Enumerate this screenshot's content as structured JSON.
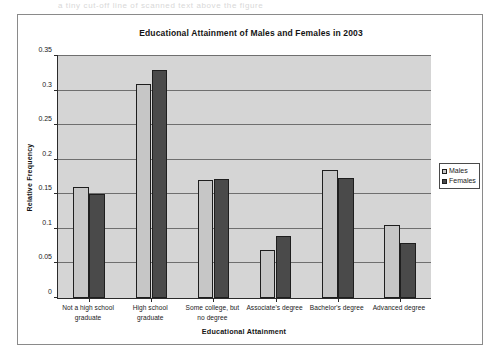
{
  "artifact_text": "a tiny cut-off line of scanned text above the figure",
  "figure": {
    "title": "Educational Attainment of Males and Females in 2003",
    "x_axis_title": "Educational Attainment",
    "y_axis_title": "Relative Frequency"
  },
  "legend": {
    "items": [
      {
        "label": "Males",
        "color": "#c6c6c6",
        "swatch": "males-swatch"
      },
      {
        "label": "Females",
        "color": "#4a4a4a",
        "swatch": "females-swatch"
      }
    ]
  },
  "chart_data": {
    "type": "bar",
    "title": "Educational Attainment of Males and Females in 2003",
    "xlabel": "Educational Attainment",
    "ylabel": "Relative Frequency",
    "categories": [
      "Not a high school graduate",
      "High school graduate",
      "Some college, but no degree",
      "Associate's degree",
      "Bachelor's degree",
      "Advanced degree"
    ],
    "category_lines": [
      [
        "Not a high school",
        "graduate"
      ],
      [
        "High school",
        "graduate"
      ],
      [
        "Some college, but",
        "no degree"
      ],
      [
        "Associate's degree"
      ],
      [
        "Bachelor's degree"
      ],
      [
        "Advanced degree"
      ]
    ],
    "series": [
      {
        "name": "Males",
        "color": "#c6c6c6",
        "values": [
          0.16,
          0.31,
          0.17,
          0.07,
          0.185,
          0.105
        ]
      },
      {
        "name": "Females",
        "color": "#4a4a4a",
        "values": [
          0.15,
          0.33,
          0.172,
          0.09,
          0.174,
          0.08
        ]
      }
    ],
    "ylim": [
      0,
      0.35
    ],
    "ytick_values": [
      0,
      0.05,
      0.1,
      0.15,
      0.2,
      0.25,
      0.3,
      0.35
    ],
    "ytick_labels": [
      "0",
      "0.05",
      "0.1",
      "0.15",
      "0.2",
      "0.25",
      "0.3",
      "0.35"
    ],
    "grid": true,
    "grid_axis": "y",
    "legend_position": "right-outside",
    "plot_background": "#d5d5d5"
  }
}
